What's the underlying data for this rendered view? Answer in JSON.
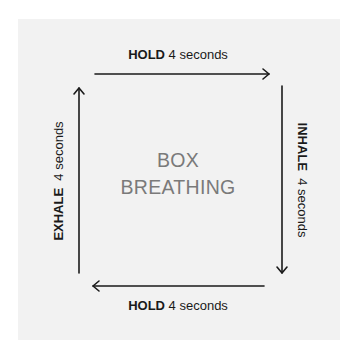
{
  "title": {
    "line1": "BOX",
    "line2": "BREATHING"
  },
  "steps": {
    "top": {
      "action": "HOLD",
      "duration": "4 seconds"
    },
    "right": {
      "action": "INHALE",
      "duration": "4 seconds"
    },
    "bottom": {
      "action": "HOLD",
      "duration": "4 seconds"
    },
    "left": {
      "action": "EXHALE",
      "duration": "4 seconds"
    }
  },
  "colors": {
    "panel": "#f2f2f2",
    "text": "#1a1a1a",
    "title": "#7a7a7a"
  }
}
